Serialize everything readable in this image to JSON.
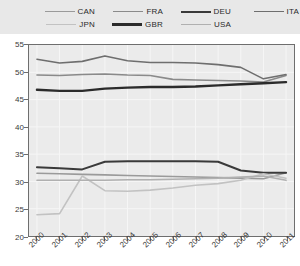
{
  "legend": {
    "position": "top",
    "rows": [
      [
        {
          "name": "CAN",
          "color": "#9a9a9a",
          "width": 1.6
        },
        {
          "name": "FRA",
          "color": "#8a8a8a",
          "width": 1.6
        },
        {
          "name": "DEU",
          "color": "#3a3a3a",
          "width": 2.0
        },
        {
          "name": "ITA",
          "color": "#6e6e6e",
          "width": 1.6
        }
      ],
      [
        {
          "name": "JPN",
          "color": "#c2c2c2",
          "width": 1.6
        },
        {
          "name": "GBR",
          "color": "#2b2b2b",
          "width": 2.4
        },
        {
          "name": "USA",
          "color": "#b0b0b0",
          "width": 1.6
        }
      ]
    ]
  },
  "chart_data": {
    "type": "line",
    "title": "",
    "xlabel": "",
    "ylabel": "",
    "x": [
      2000,
      2001,
      2002,
      2003,
      2004,
      2005,
      2006,
      2007,
      2008,
      2009,
      2010,
      2011
    ],
    "categories": [
      "2000",
      "2001",
      "2002",
      "2003",
      "2004",
      "2005",
      "2006",
      "2007",
      "2008",
      "2009",
      "2010",
      "2011"
    ],
    "ylim": [
      20,
      55
    ],
    "yticks": [
      20,
      25,
      30,
      35,
      40,
      45,
      50,
      55
    ],
    "grid": true,
    "legend_position": "top",
    "series": [
      {
        "name": "CAN",
        "color": "#9a9a9a",
        "width": 1.6,
        "values": [
          31.5,
          31.4,
          31.3,
          31.2,
          31.1,
          31.0,
          30.9,
          30.8,
          30.7,
          30.6,
          30.5,
          31.6
        ]
      },
      {
        "name": "FRA",
        "color": "#8a8a8a",
        "width": 1.6,
        "values": [
          49.5,
          49.4,
          49.6,
          49.7,
          49.5,
          49.4,
          48.7,
          48.6,
          48.5,
          48.4,
          48.2,
          49.4
        ]
      },
      {
        "name": "DEU",
        "color": "#3a3a3a",
        "width": 2.0,
        "values": [
          32.6,
          32.4,
          32.2,
          33.6,
          33.7,
          33.7,
          33.7,
          33.7,
          33.6,
          32.0,
          31.6,
          31.6
        ]
      },
      {
        "name": "ITA",
        "color": "#6e6e6e",
        "width": 1.6,
        "values": [
          52.4,
          51.7,
          52.0,
          53.0,
          52.1,
          51.8,
          51.8,
          51.7,
          51.4,
          50.9,
          48.8,
          49.6
        ]
      },
      {
        "name": "JPN",
        "color": "#c2c2c2",
        "width": 1.6,
        "values": [
          23.9,
          24.1,
          31.0,
          28.3,
          28.2,
          28.4,
          28.8,
          29.3,
          29.6,
          30.2,
          31.4,
          30.6
        ]
      },
      {
        "name": "GBR",
        "color": "#2b2b2b",
        "width": 2.4,
        "values": [
          46.8,
          46.6,
          46.6,
          47.0,
          47.2,
          47.3,
          47.3,
          47.4,
          47.6,
          47.8,
          48.0,
          48.2
        ]
      },
      {
        "name": "USA",
        "color": "#b0b0b0",
        "width": 1.6,
        "values": [
          30.2,
          30.2,
          30.2,
          30.2,
          30.3,
          30.3,
          30.4,
          30.5,
          30.6,
          30.8,
          31.0,
          30.2
        ]
      }
    ]
  }
}
